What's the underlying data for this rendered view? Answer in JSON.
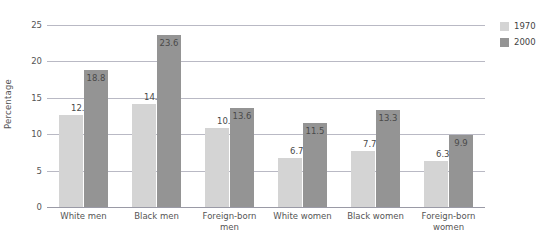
{
  "chart_data": {
    "type": "bar",
    "title": "",
    "xlabel": "",
    "ylabel": "Percentage",
    "ylim": [
      0,
      25
    ],
    "yticks": [
      0,
      5,
      10,
      15,
      20,
      25
    ],
    "ytick_labels": [
      "0",
      "5",
      "10",
      "15",
      "20",
      "25"
    ],
    "grid": true,
    "legend_position": "right",
    "categories": [
      "White men",
      "Black men",
      "Foreign-born men",
      "White women",
      "Black women",
      "Foreign-born women"
    ],
    "category_lines": [
      [
        "White men"
      ],
      [
        "Black men"
      ],
      [
        "Foreign-born",
        "men"
      ],
      [
        "White women"
      ],
      [
        "Black women"
      ],
      [
        "Foreign-born",
        "women"
      ]
    ],
    "series": [
      {
        "name": "1970",
        "color": "#d4d4d4",
        "values": [
          12.7,
          14.2,
          10.9,
          6.7,
          7.7,
          6.3
        ],
        "labels": [
          "12.7",
          "14.2",
          "10.9",
          "6.7",
          "7.7",
          "6.3"
        ]
      },
      {
        "name": "2000",
        "color": "#949494",
        "values": [
          18.8,
          23.6,
          13.6,
          11.5,
          13.3,
          9.9
        ],
        "labels": [
          "18.8",
          "23.6",
          "13.6",
          "11.5",
          "13.3",
          "9.9"
        ]
      }
    ]
  },
  "legend": {
    "items": [
      {
        "label": "1970",
        "swatch": "s1970"
      },
      {
        "label": "2000",
        "swatch": "s2000"
      }
    ]
  },
  "colors": {
    "series_1970": "#d4d4d4",
    "series_2000": "#949494",
    "gridline": "#b9b9c4",
    "text": "#555555",
    "background": "#ffffff"
  }
}
